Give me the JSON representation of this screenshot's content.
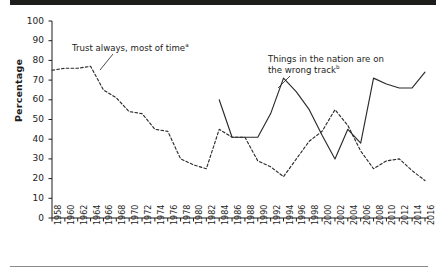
{
  "figure": {
    "top_bar_color": "#1d1d1b",
    "background": "#ffffff",
    "axis_color": "#1d1d1b",
    "series_color": "#2b2b2b"
  },
  "axis": {
    "ylabel": "Percentage",
    "yticks": [
      "100",
      "90",
      "80",
      "70",
      "60",
      "50",
      "40",
      "30",
      "20",
      "10",
      "0"
    ],
    "xticks": [
      "1958",
      "1960",
      "1962",
      "1964",
      "1966",
      "1968",
      "1970",
      "1972",
      "1974",
      "1976",
      "1978",
      "1980",
      "1982",
      "1984",
      "1986",
      "1988",
      "1990",
      "1992",
      "1994",
      "1996",
      "1998",
      "2000",
      "2002",
      "2004",
      "2006",
      "2008",
      "2010",
      "2012",
      "2014",
      "2016"
    ]
  },
  "annotations": {
    "trust": {
      "text": "Trust always, most of time",
      "sup": "a"
    },
    "wrong_track_line1": "Things in the nation are on",
    "wrong_track_line2": {
      "text": "the wrong track",
      "sup": "b"
    }
  },
  "chart_data": {
    "type": "line",
    "title": "",
    "xlabel": "",
    "ylabel": "Percentage",
    "ylim": [
      0,
      100
    ],
    "yticks": [
      0,
      10,
      20,
      30,
      40,
      50,
      60,
      70,
      80,
      90,
      100
    ],
    "grid": false,
    "legend": "annotations-inline",
    "x": [
      1958,
      1960,
      1962,
      1964,
      1966,
      1968,
      1970,
      1972,
      1974,
      1976,
      1978,
      1980,
      1982,
      1984,
      1986,
      1988,
      1990,
      1992,
      1994,
      1996,
      1998,
      2000,
      2002,
      2004,
      2006,
      2008,
      2010,
      2012,
      2014,
      2016
    ],
    "series": [
      {
        "name": "Trust always, most of time",
        "style": "dashed",
        "values": [
          75,
          76,
          76,
          77,
          65,
          61,
          54,
          53,
          45,
          44,
          30,
          27,
          25,
          45,
          41,
          41,
          29,
          26,
          21,
          30,
          39,
          44,
          55,
          47,
          34,
          25,
          29,
          30,
          24,
          19
        ]
      },
      {
        "name": "Things in the nation are on the wrong track",
        "style": "solid",
        "values": [
          null,
          null,
          null,
          null,
          null,
          null,
          null,
          null,
          null,
          null,
          null,
          null,
          null,
          60,
          41,
          41,
          41,
          53,
          71,
          64,
          55,
          42,
          30,
          45,
          38,
          71,
          68,
          66,
          66,
          74
        ]
      }
    ]
  }
}
